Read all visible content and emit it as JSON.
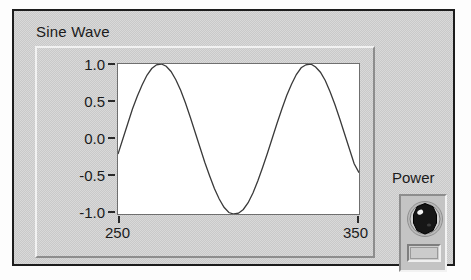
{
  "panel": {
    "background_color": "#c9c9c9",
    "border_color": "#1d1d1d"
  },
  "graph": {
    "title": "Sine Wave",
    "plot_background": "#ffffff",
    "trace_color": "#3a3a3a"
  },
  "power": {
    "label": "Power",
    "knob_icon": "rotary-knob-icon",
    "knob_color": "#1a1a1a",
    "indicator_value": ""
  },
  "chart_data": {
    "type": "line",
    "title": "Sine Wave",
    "xlabel": "",
    "ylabel": "",
    "xlim": [
      250,
      350
    ],
    "ylim": [
      -1.0,
      1.0
    ],
    "grid": false,
    "legend": null,
    "x_tick_labels": [
      "250",
      "350"
    ],
    "x_ticks": [
      250,
      350
    ],
    "y_tick_labels": [
      "1.0",
      "0.5",
      "0.0",
      "-0.5",
      "-1.0"
    ],
    "y_ticks": [
      1.0,
      0.5,
      0.0,
      -0.5,
      -1.0
    ],
    "series": [
      {
        "name": "Sine Wave",
        "amplitude": 1.0,
        "period": 55,
        "phase_deg": -11.5,
        "x": [
          250,
          252,
          254,
          256,
          258,
          260,
          262,
          264,
          266,
          268,
          270,
          272,
          274,
          276,
          278,
          280,
          282,
          284,
          286,
          288,
          290,
          292,
          294,
          296,
          298,
          300,
          302,
          304,
          306,
          308,
          310,
          312,
          314,
          316,
          318,
          320,
          322,
          324,
          326,
          328,
          330,
          332,
          334,
          336,
          338,
          340,
          342,
          344,
          346,
          348,
          350
        ],
        "values": [
          -0.2,
          -0.0,
          0.2,
          0.4,
          0.57,
          0.72,
          0.85,
          0.94,
          0.99,
          1.0,
          0.97,
          0.9,
          0.79,
          0.65,
          0.48,
          0.29,
          0.09,
          -0.11,
          -0.31,
          -0.49,
          -0.66,
          -0.8,
          -0.91,
          -0.98,
          -1.0,
          -0.99,
          -0.94,
          -0.85,
          -0.72,
          -0.56,
          -0.38,
          -0.19,
          0.01,
          0.21,
          0.4,
          0.58,
          0.73,
          0.86,
          0.95,
          0.99,
          1.0,
          0.96,
          0.89,
          0.78,
          0.63,
          0.46,
          0.27,
          0.07,
          -0.13,
          -0.33,
          -0.45
        ]
      }
    ]
  }
}
